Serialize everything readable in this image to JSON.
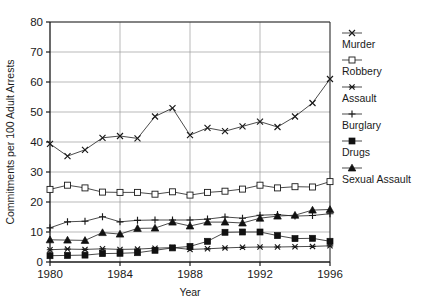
{
  "chart_data": {
    "type": "line",
    "title": "",
    "xlabel": "Year",
    "ylabel": "Commitments per 100 Adult Arrests",
    "xlim": [
      1980,
      1996
    ],
    "ylim": [
      0,
      80
    ],
    "ytick_step": 10,
    "xtick_step": 4,
    "grid": true,
    "legend_position": "right",
    "xticks": [
      "1980",
      "1984",
      "1988",
      "1992",
      "1996"
    ],
    "yticks": [
      "0",
      "10",
      "20",
      "30",
      "40",
      "50",
      "60",
      "70",
      "80"
    ],
    "x": [
      1980,
      1981,
      1982,
      1983,
      1984,
      1985,
      1986,
      1987,
      1988,
      1989,
      1990,
      1991,
      1992,
      1993,
      1994,
      1995,
      1996
    ],
    "series": [
      {
        "name": "Murder",
        "marker": "x-cross",
        "values": [
          39.4,
          35.3,
          37.4,
          41.4,
          42.0,
          41.2,
          48.5,
          51.3,
          42.3,
          44.7,
          43.6,
          45.2,
          46.8,
          45.0,
          48.5,
          53.0,
          61.0
        ]
      },
      {
        "name": "Robbery",
        "marker": "open-square",
        "values": [
          24.2,
          25.6,
          24.7,
          23.3,
          23.2,
          23.2,
          22.6,
          23.4,
          22.3,
          23.2,
          23.6,
          24.3,
          25.6,
          24.7,
          25.1,
          25.0,
          26.8
        ]
      },
      {
        "name": "Assault",
        "marker": "asterisk",
        "values": [
          4.1,
          4.3,
          4.2,
          4.4,
          4.2,
          4.3,
          4.6,
          4.8,
          4.2,
          4.4,
          4.7,
          4.9,
          5.0,
          5.0,
          5.1,
          5.2,
          5.4
        ]
      },
      {
        "name": "Burglary",
        "marker": "plus",
        "values": [
          11.4,
          13.4,
          13.6,
          15.1,
          13.4,
          13.9,
          14.0,
          14.0,
          14.0,
          14.3,
          15.0,
          14.6,
          15.6,
          15.8,
          15.3,
          15.5,
          16.1
        ]
      },
      {
        "name": "Drugs",
        "marker": "solid-square",
        "values": [
          2.1,
          2.2,
          2.3,
          2.8,
          2.9,
          3.1,
          3.9,
          4.7,
          5.2,
          6.9,
          9.9,
          10.0,
          10.0,
          8.8,
          7.8,
          7.9,
          6.9
        ]
      },
      {
        "name": "Sexual Assault",
        "marker": "solid-triangle",
        "values": [
          7.4,
          7.3,
          7.2,
          9.8,
          9.3,
          11.2,
          11.3,
          13.3,
          12.0,
          13.3,
          13.3,
          13.0,
          14.6,
          15.3,
          15.6,
          17.3,
          17.5
        ]
      }
    ]
  },
  "bottom_artifact": {
    "text": ""
  }
}
